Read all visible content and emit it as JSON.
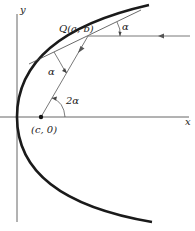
{
  "diagram": {
    "type": "parabola-reflection-property",
    "axes": {
      "x_label": "x",
      "y_label": "y"
    },
    "points": {
      "Q": {
        "label": "Q(a, b)"
      },
      "focus": {
        "label": "(c, 0)"
      }
    },
    "angles": {
      "incoming": "α",
      "reflected": "α",
      "at_focus": "2α"
    },
    "colors": {
      "curve": "#1a1a1a",
      "axis": "#555555",
      "line": "#444444",
      "background": "#ffffff"
    }
  }
}
